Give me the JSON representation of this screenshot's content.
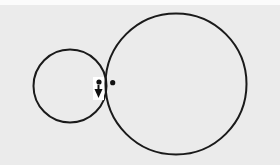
{
  "diagram": {
    "type": "geometry",
    "background_color": "#ebebeb",
    "top_strip_color": "#fbfbfb",
    "stroke_color": "#1a1a1a",
    "stroke_width": 2,
    "small_circle": {
      "cx": 70,
      "cy": 86,
      "r": 36.5
    },
    "large_circle": {
      "cx": 176,
      "cy": 84,
      "r": 70.5
    },
    "contact_point": {
      "x": 106,
      "y": 84
    },
    "points": [
      {
        "name": "point-left",
        "cx": 99,
        "cy": 82,
        "r": 2.6,
        "color": "#111111"
      },
      {
        "name": "point-right",
        "cx": 112.7,
        "cy": 82.7,
        "r": 2.6,
        "color": "#111111"
      }
    ],
    "arrow": {
      "direction": "down",
      "shaft": {
        "x": 98.5,
        "y1": 85,
        "y2": 90
      },
      "head": {
        "left_x": 94.5,
        "right_x": 102.5,
        "base_y": 89,
        "tip_x": 98.5,
        "tip_y": 98
      },
      "label_background": {
        "x": 93,
        "y": 77,
        "width": 11,
        "height": 23,
        "color": "#ffffff"
      },
      "color": "#111111"
    }
  }
}
